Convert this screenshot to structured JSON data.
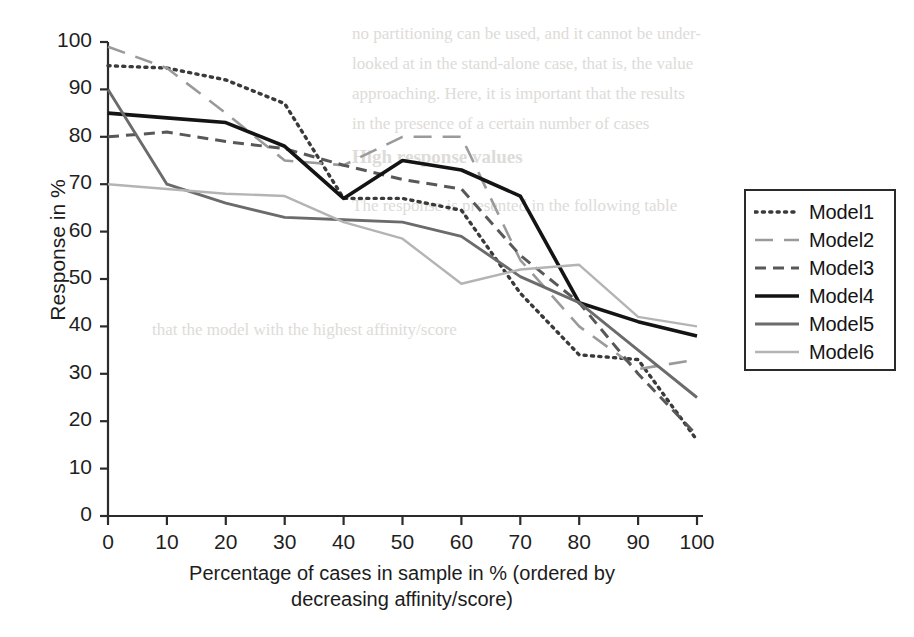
{
  "chart_data": {
    "type": "line",
    "title": "",
    "xlabel": "Percentage of cases in sample in % (ordered by decreasing affinity/score)",
    "xlabel_line1": "Percentage of cases in sample in % (ordered by",
    "xlabel_line2": "decreasing affinity/score)",
    "ylabel": "Response in %",
    "xlim": [
      0,
      100
    ],
    "ylim": [
      0,
      100
    ],
    "xticks": [
      0,
      10,
      20,
      30,
      40,
      50,
      60,
      70,
      80,
      90,
      100
    ],
    "yticks": [
      0,
      10,
      20,
      30,
      40,
      50,
      60,
      70,
      80,
      90,
      100
    ],
    "xticklabels": [
      "0",
      "10",
      "20",
      "30",
      "40",
      "50",
      "60",
      "70",
      "80",
      "90",
      "100"
    ],
    "yticklabels": [
      "0",
      "10",
      "20",
      "30",
      "40",
      "50",
      "60",
      "70",
      "80",
      "90",
      "100"
    ],
    "grid": false,
    "legend_position": "right",
    "x": [
      0,
      10,
      20,
      30,
      40,
      50,
      60,
      70,
      80,
      90,
      100
    ],
    "series": [
      {
        "name": "Model1",
        "values": [
          95,
          94.5,
          92,
          87,
          67,
          67,
          64.5,
          47,
          34,
          33,
          16
        ],
        "style": "dotted",
        "color": "#3a3a3a",
        "width": 3.4
      },
      {
        "name": "Model2",
        "values": [
          99,
          94.5,
          85,
          75,
          74,
          80,
          80,
          54,
          40,
          31,
          33
        ],
        "style": "longdash",
        "color": "#9a9a9a",
        "width": 2.6
      },
      {
        "name": "Model3",
        "values": [
          80,
          81,
          79,
          77.5,
          74,
          71,
          69,
          55,
          45,
          30,
          17
        ],
        "style": "dash",
        "color": "#585858",
        "width": 3.0
      },
      {
        "name": "Model4",
        "values": [
          85,
          84,
          83,
          78,
          67,
          75,
          73,
          67.5,
          45,
          41,
          38
        ],
        "style": "solid",
        "color": "#141414",
        "width": 3.6
      },
      {
        "name": "Model5",
        "values": [
          90,
          70,
          66,
          63,
          62.5,
          62,
          59,
          50.5,
          45,
          35,
          25
        ],
        "style": "solid",
        "color": "#6b6b6b",
        "width": 2.9
      },
      {
        "name": "Model6",
        "values": [
          70,
          69,
          68,
          67.5,
          62,
          58.5,
          49,
          52,
          53,
          42,
          40
        ],
        "style": "solid",
        "color": "#b4b4b4",
        "width": 2.4
      }
    ]
  },
  "legend": {
    "items": [
      {
        "label": "Model1"
      },
      {
        "label": "Model2"
      },
      {
        "label": "Model3"
      },
      {
        "label": "Model4"
      },
      {
        "label": "Model5"
      },
      {
        "label": "Model6"
      }
    ]
  },
  "background_text": {
    "lines": [
      "no partitioning can be used, and it cannot be under-",
      "looked at in the stand-alone case, that is, the value",
      "approaching. Here, it is important that the results",
      "in the presence of a certain number of cases",
      "High response values",
      "The response is presented in the following table",
      "that the model with the highest affinity/score"
    ]
  }
}
